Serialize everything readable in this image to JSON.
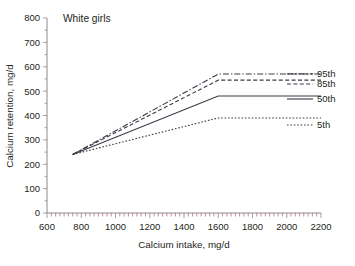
{
  "chart_data": {
    "type": "line",
    "title": "White girls",
    "xlabel": "Calcium intake, mg/d",
    "ylabel": "Calcium retention, mg/d",
    "xlim": [
      600,
      2200
    ],
    "ylim": [
      0,
      800
    ],
    "xticks": [
      600,
      800,
      1000,
      1200,
      1400,
      1600,
      1800,
      2000,
      2200
    ],
    "yticks": [
      0,
      100,
      200,
      300,
      400,
      500,
      600,
      700,
      800
    ],
    "grid": false,
    "legend_position": "right",
    "series": [
      {
        "name": "95th",
        "style": "dashdot",
        "x": [
          750,
          1600,
          2200
        ],
        "values": [
          240,
          570,
          570
        ]
      },
      {
        "name": "85th",
        "style": "dashed",
        "x": [
          750,
          1600,
          2200
        ],
        "values": [
          240,
          545,
          545
        ]
      },
      {
        "name": "50th",
        "style": "solid",
        "x": [
          750,
          1600,
          2200
        ],
        "values": [
          240,
          480,
          480
        ]
      },
      {
        "name": "5th",
        "style": "dotted",
        "x": [
          750,
          1600,
          2200
        ],
        "values": [
          240,
          390,
          390
        ]
      }
    ]
  },
  "axes": {
    "x": {
      "title": "Calcium intake, mg/d",
      "tick_labels": [
        "600",
        "800",
        "1000",
        "1200",
        "1400",
        "1600",
        "1800",
        "2000",
        "2200"
      ]
    },
    "y": {
      "title": "Calcium retention, mg/d",
      "tick_labels": [
        "0",
        "100",
        "200",
        "300",
        "400",
        "500",
        "600",
        "700",
        "800"
      ]
    }
  },
  "title": "White girls",
  "legend": {
    "entries": [
      {
        "label": "95th"
      },
      {
        "label": "85th"
      },
      {
        "label": "50th"
      },
      {
        "label": "5th"
      }
    ]
  },
  "colors": {
    "line": "#3a3a48",
    "axis": "#8b8b8b",
    "text": "#231f20",
    "background": "#ffffff"
  }
}
